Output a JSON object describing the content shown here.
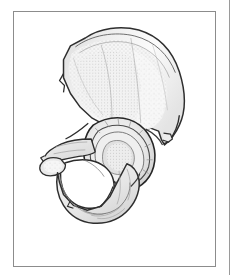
{
  "figure": {
    "type": "anatomical-illustration",
    "region": "pelvis",
    "view": "lateral / external surface",
    "style": "stippled pen-and-ink line drawing, grayscale",
    "caption": "",
    "label_text": "",
    "alt_text": "Lateral view of the right hip bone showing the ilium, ischium, pubis, acetabulum and obturator foramen",
    "structures": [
      {
        "name": "iliac-crest",
        "label": ""
      },
      {
        "name": "iliac-fossa",
        "label": ""
      },
      {
        "name": "anterior-superior-iliac-spine",
        "label": ""
      },
      {
        "name": "anterior-inferior-iliac-spine",
        "label": ""
      },
      {
        "name": "posterior-superior-iliac-spine",
        "label": ""
      },
      {
        "name": "greater-sciatic-notch",
        "label": ""
      },
      {
        "name": "ischial-spine",
        "label": ""
      },
      {
        "name": "lesser-sciatic-notch",
        "label": ""
      },
      {
        "name": "acetabulum",
        "label": ""
      },
      {
        "name": "acetabular-notch",
        "label": ""
      },
      {
        "name": "obturator-foramen",
        "label": ""
      },
      {
        "name": "superior-pubic-ramus",
        "label": ""
      },
      {
        "name": "inferior-pubic-ramus",
        "label": ""
      },
      {
        "name": "ischial-tuberosity",
        "label": ""
      },
      {
        "name": "ischial-ramus",
        "label": ""
      }
    ]
  },
  "colors": {
    "page_background": "#ffffff",
    "panel_border": "#8c8c8c",
    "divider": "#9a9a9a",
    "outline_dark": "#2b2b2b",
    "outline_mid": "#5a5a5a",
    "bone_fill_light": "#f4f4f4",
    "bone_fill_mid": "#e2e2e2",
    "bone_fill_shadow": "#c9c9c9",
    "stipple": "#8a8a8a",
    "foramen_fill": "#ffffff"
  },
  "panel": {
    "x": 13,
    "y": 11,
    "width": 203,
    "height": 256
  },
  "divider": {
    "x": 229,
    "y": 0,
    "height": 275
  }
}
